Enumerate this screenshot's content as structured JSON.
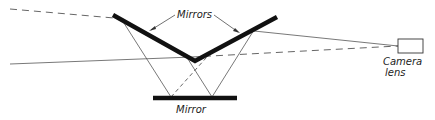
{
  "diagram": {
    "labels": {
      "mirrors": "Mirrors",
      "mirror": "Mirror",
      "camera_line1": "Camera",
      "camera_line2": "lens"
    },
    "elements": {
      "upper_mirrors": {
        "left": [
          [
            113,
            15
          ],
          [
            195,
            61
          ]
        ],
        "right": [
          [
            195,
            61
          ],
          [
            277,
            17
          ]
        ]
      },
      "lower_mirror": [
        [
          153,
          98
        ],
        [
          237,
          98
        ]
      ],
      "camera_box": {
        "x": 398,
        "y": 39,
        "w": 25,
        "h": 14
      }
    },
    "colors": {
      "ink": "#111111",
      "ray": "#555555",
      "background": "#ffffff"
    }
  }
}
